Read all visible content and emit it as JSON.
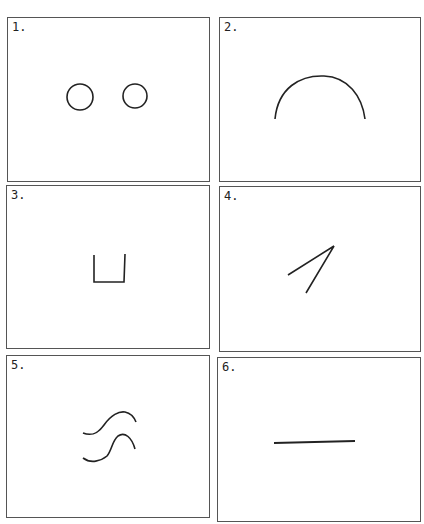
{
  "figure": {
    "panels": [
      {
        "label": "1.",
        "description": "two small circles"
      },
      {
        "label": "2.",
        "description": "arc / upside-down U curve"
      },
      {
        "label": "3.",
        "description": "square U-shaped open box"
      },
      {
        "label": "4.",
        "description": "two lines meeting at an acute angle"
      },
      {
        "label": "5.",
        "description": "two wavy S-like curves"
      },
      {
        "label": "6.",
        "description": "horizontal straight line"
      }
    ],
    "stroke_color": "#222222",
    "border_color": "#555555"
  }
}
